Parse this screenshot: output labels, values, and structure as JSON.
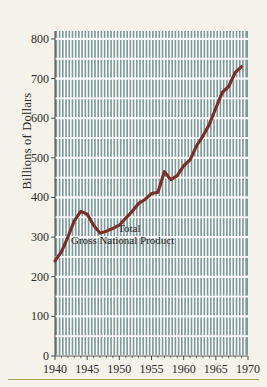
{
  "figure": {
    "background_color": "#f4f2e9",
    "plot_fill_color": "#7d9a99",
    "grid_color": "#ffffff",
    "line_color": "#7b2d26",
    "text_color": "#2a2a28",
    "rule_color": "#a9a05a"
  },
  "axes": {
    "ylabel": "Billions of Dollars",
    "yticks": [
      "0",
      "100",
      "200",
      "300",
      "400",
      "500",
      "600",
      "700",
      "800"
    ],
    "xticks": [
      "1940",
      "1945",
      "1950",
      "1955",
      "1960",
      "1965",
      "1970"
    ]
  },
  "annotations": {
    "line1": "Total",
    "line2": "Gross National Product"
  },
  "chart_data": {
    "type": "line",
    "title": "",
    "subtitle": "",
    "xlabel": "",
    "ylabel": "Billions of Dollars",
    "xlim": [
      1940,
      1970
    ],
    "ylim": [
      0,
      820
    ],
    "grid": true,
    "legend": "none",
    "annotations": [
      "Total",
      "Gross National Product"
    ],
    "series": [
      {
        "name": "Total Gross National Product",
        "color": "#7b2d26",
        "x": [
          1940,
          1941,
          1942,
          1943,
          1944,
          1945,
          1946,
          1947,
          1948,
          1949,
          1950,
          1951,
          1952,
          1953,
          1954,
          1955,
          1956,
          1957,
          1958,
          1959,
          1960,
          1961,
          1962,
          1963,
          1964,
          1965,
          1966,
          1967,
          1968,
          1969
        ],
        "values": [
          240,
          263,
          300,
          341,
          365,
          358,
          330,
          310,
          315,
          322,
          330,
          348,
          365,
          385,
          395,
          410,
          413,
          465,
          445,
          455,
          480,
          495,
          530,
          555,
          585,
          625,
          665,
          680,
          715,
          730
        ]
      }
    ]
  }
}
